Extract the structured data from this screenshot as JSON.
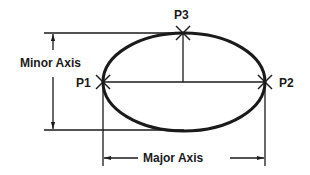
{
  "diagram": {
    "labels": {
      "minor_axis": "Minor Axis",
      "major_axis": "Major Axis",
      "p1": "P1",
      "p2": "P2",
      "p3": "P3"
    },
    "colors": {
      "stroke": "#1a1a1a",
      "background": "#ffffff"
    },
    "ellipse": {
      "cx": 184,
      "cy": 82,
      "rx": 81,
      "ry": 49
    },
    "points": [
      {
        "id": "P1",
        "x": 103,
        "y": 82
      },
      {
        "id": "P2",
        "x": 265,
        "y": 82
      },
      {
        "id": "P3",
        "x": 183,
        "y": 33
      }
    ]
  }
}
